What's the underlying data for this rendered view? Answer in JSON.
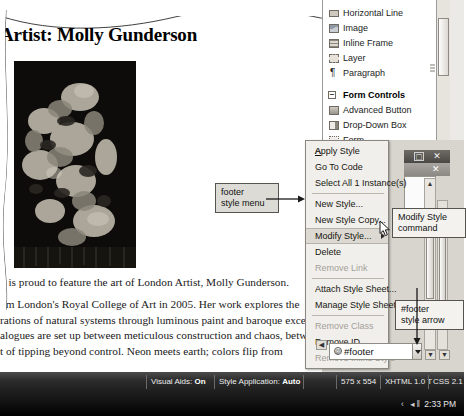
{
  "app": "Microsoft Expression Web",
  "document": {
    "title": "Artist: Molly Gunderson",
    "artwork_alt": "dark floral rose painting",
    "paragraphs": [
      "y is proud to feature the art of London Artist, Molly Gunderson.",
      "om London's Royal College of Art in 2005. Her work explores the",
      "rations of natural systems through luminous paint and baroque excesses",
      "alogues are set up between meticulous construction and chaos, between",
      "t of tipping beyond control. Neon meets earth; colors flip from"
    ]
  },
  "toolbox": {
    "items": [
      {
        "label": "Horizontal Line",
        "icon": "horizontal-line-icon",
        "cls": "line"
      },
      {
        "label": "Image",
        "icon": "image-icon",
        "cls": "img"
      },
      {
        "label": "Inline Frame",
        "icon": "inline-frame-icon",
        "cls": "frame"
      },
      {
        "label": "Layer",
        "icon": "layer-icon",
        "cls": "layer"
      },
      {
        "label": "Paragraph",
        "icon": "paragraph-icon",
        "cls": "para",
        "glyph": "¶"
      }
    ],
    "group": {
      "label": "Form Controls",
      "expander": "−",
      "items": [
        {
          "label": "Advanced Button",
          "icon": "advanced-button-icon",
          "cls": "btn"
        },
        {
          "label": "Drop-Down Box",
          "icon": "drop-down-box-icon",
          "cls": "ddl"
        },
        {
          "label": "Form",
          "icon": "form-icon",
          "cls": "form"
        }
      ]
    }
  },
  "context_menu": {
    "items": [
      {
        "label": "Apply Style",
        "state": "normal",
        "accel": "A"
      },
      {
        "label": "Go To Code",
        "state": "normal",
        "accel": "G"
      },
      {
        "label": "Select All 1 Instance(s)",
        "state": "normal",
        "accel": "S"
      },
      {
        "sep": true
      },
      {
        "label": "New Style...",
        "state": "normal",
        "accel": "N"
      },
      {
        "label": "New Style Copy...",
        "state": "normal",
        "accel": "C"
      },
      {
        "label": "Modify Style...",
        "state": "selected",
        "accel": "M",
        "submenu": true
      },
      {
        "label": "Delete",
        "state": "normal",
        "accel": "D"
      },
      {
        "label": "Remove Link",
        "state": "disabled"
      },
      {
        "sep": true
      },
      {
        "label": "Attach Style Sheet...",
        "state": "normal",
        "accel": "tt"
      },
      {
        "label": "Manage Style Sheet Links...",
        "state": "normal",
        "accel": "L"
      },
      {
        "sep": true
      },
      {
        "label": "Remove Class",
        "state": "disabled"
      },
      {
        "label": "Remove ID",
        "state": "normal",
        "accel": "ID"
      },
      {
        "label": "Remove Inline Style",
        "state": "disabled"
      }
    ]
  },
  "footer_bar": {
    "style_name": "#footer",
    "at_glyph": "@",
    "dropdown_icon": "chevron-down-icon"
  },
  "window_controls": {
    "maximize": "□",
    "close": "✕"
  },
  "callouts": [
    {
      "id": "footer-style-menu",
      "text": "footer\nstyle menu"
    },
    {
      "id": "modify-style-command",
      "text": "Modify Style\ncommand"
    },
    {
      "id": "footer-style-arrow",
      "text": "#footer\nstyle arrow"
    }
  ],
  "status_bar": {
    "visual_aids_label": "Visual Aids:",
    "visual_aids_value": "On",
    "style_application_label": "Style Application:",
    "style_application_value": "Auto",
    "dimensions": "575 x 554",
    "doctype": "XHTML 1.0 T",
    "css_version": "CSS 2.1"
  },
  "taskbar": {
    "clock": "2:33 PM",
    "tray_icons": "‹ ◂‖"
  },
  "colors": {
    "menu_bg": "#f1efec",
    "menu_selected": "#dcd9d2",
    "callout_bg": "#dddbd6",
    "status_bg": "#2c2c2c",
    "artwork_bg": "#100e0c"
  }
}
